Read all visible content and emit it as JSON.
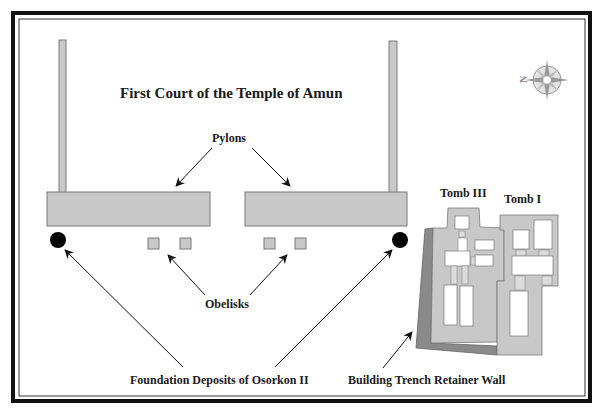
{
  "diagram": {
    "title": "First Court of the Temple of Amun",
    "labels": {
      "pylons": "Pylons",
      "obelisks": "Obelisks",
      "foundation_deposits": "Foundation Deposits of Osorkon II",
      "retainer_wall": "Building Trench Retainer Wall",
      "tomb_iii": "Tomb III",
      "tomb_i": "Tomb I"
    },
    "compass": {
      "north_label": "N"
    },
    "colors": {
      "structure_fill": "#c8c8c8",
      "structure_stroke": "#7a7a7a",
      "retainer_wall_fill": "#8a8a8a",
      "deposit_fill": "#000000",
      "border": "#111111"
    }
  }
}
